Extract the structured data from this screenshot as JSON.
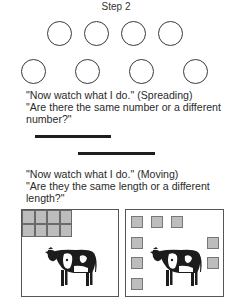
{
  "title": "Step 2",
  "figure_1": {
    "top_row_circle_count": 4,
    "bottom_row_circle_count": 4,
    "line_1": "\"Now watch what I do.\" (Spreading)",
    "line_2": "\"Are there the same number or a different",
    "line_3": "number?\""
  },
  "figure_2": {
    "line_1": "\"Now watch what I do.\" (Moving)",
    "line_2": "\"Are they the same length or a different",
    "line_3": "length?\""
  },
  "figure_3": {
    "left_box": {
      "block_grid": "4 x 2 blocks grouped in corner",
      "animal": "cow"
    },
    "right_box": {
      "block_count": 8,
      "arrangement": "blocks spread around the edges",
      "animal": "cow"
    }
  },
  "colors": {
    "stroke": "#3a3a3a",
    "block_fill": "#bdbdbd",
    "bar": "#1e1e1e"
  }
}
